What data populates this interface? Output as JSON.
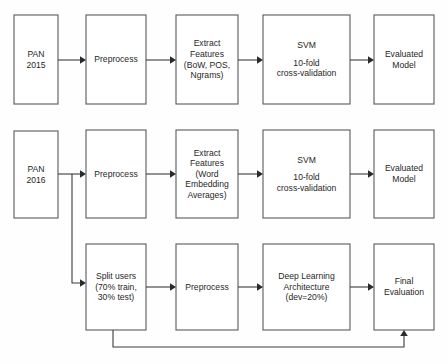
{
  "diagram": {
    "colors": {
      "background": "#fefefe",
      "box_fill": "#ffffff",
      "box_stroke": "#58595b",
      "edge_stroke": "#3b3b3b",
      "text": "#1f1f1f"
    },
    "rows": [
      {
        "id": "row-pan-2015",
        "nodes": [
          {
            "id": "pan-2015",
            "lines": [
              "PAN",
              "2015"
            ]
          },
          {
            "id": "preprocess-2015",
            "lines": [
              "Preprocess"
            ]
          },
          {
            "id": "extract-features-2015",
            "lines": [
              "Extract",
              "Features",
              "(BoW, POS,",
              "Ngrams)"
            ]
          },
          {
            "id": "svm-2015",
            "lines": [
              "SVM"
            ],
            "lines_lower": [
              "10-fold",
              "cross-validation"
            ]
          },
          {
            "id": "evaluated-model-2015",
            "lines": [
              "Evaluated",
              "Model"
            ]
          }
        ]
      },
      {
        "id": "row-pan-2016",
        "nodes": [
          {
            "id": "pan-2016",
            "lines": [
              "PAN",
              "2016"
            ]
          },
          {
            "id": "preprocess-2016",
            "lines": [
              "Preprocess"
            ]
          },
          {
            "id": "extract-features-2016",
            "lines": [
              "Extract",
              "Features",
              "(Word",
              "Embedding",
              "Averages)"
            ]
          },
          {
            "id": "svm-2016",
            "lines": [
              "SVM"
            ],
            "lines_lower": [
              "10-fold",
              "cross-validation"
            ]
          },
          {
            "id": "evaluated-model-2016",
            "lines": [
              "Evaluated",
              "Model"
            ]
          }
        ]
      },
      {
        "id": "row-deep-learning",
        "nodes": [
          {
            "id": "split-users",
            "lines": [
              "Split users",
              "(70% train,",
              "30% test)"
            ]
          },
          {
            "id": "preprocess-dl",
            "lines": [
              "Preprocess"
            ]
          },
          {
            "id": "deep-learning-architecture",
            "lines": [
              "Deep Learning",
              "Architecture",
              "(dev=20%)"
            ]
          },
          {
            "id": "final-evaluation",
            "lines": [
              "Final",
              "Evaluation"
            ]
          }
        ]
      }
    ],
    "labels": {
      "pan_2015_line1": "PAN",
      "pan_2015_line2": "2015",
      "preprocess_2015": "Preprocess",
      "extract_2015_line1": "Extract",
      "extract_2015_line2": "Features",
      "extract_2015_line3": "(BoW, POS,",
      "extract_2015_line4": "Ngrams)",
      "svm_2015_title": "SVM",
      "svm_2015_line1": "10-fold",
      "svm_2015_line2": "cross-validation",
      "evaluated_2015_line1": "Evaluated",
      "evaluated_2015_line2": "Model",
      "pan_2016_line1": "PAN",
      "pan_2016_line2": "2016",
      "preprocess_2016": "Preprocess",
      "extract_2016_line1": "Extract",
      "extract_2016_line2": "Features",
      "extract_2016_line3": "(Word",
      "extract_2016_line4": "Embedding",
      "extract_2016_line5": "Averages)",
      "svm_2016_title": "SVM",
      "svm_2016_line1": "10-fold",
      "svm_2016_line2": "cross-validation",
      "evaluated_2016_line1": "Evaluated",
      "evaluated_2016_line2": "Model",
      "split_users_line1": "Split users",
      "split_users_line2": "(70% train,",
      "split_users_line3": "30% test)",
      "preprocess_dl": "Preprocess",
      "deep_learning_line1": "Deep Learning",
      "deep_learning_line2": "Architecture",
      "deep_learning_line3": "(dev=20%)",
      "final_evaluation_line1": "Final",
      "final_evaluation_line2": "Evaluation"
    }
  }
}
